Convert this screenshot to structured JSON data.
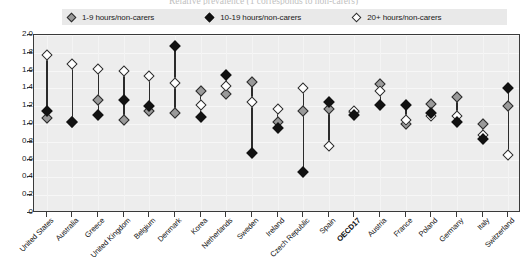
{
  "title": "Relative prevalence (1 corresponds to non-carers)",
  "legend": {
    "items": [
      {
        "label": "1-9 hours/non-carers",
        "marker": "gray-diamond-icon",
        "color": "#9a9a9a"
      },
      {
        "label": "10-19 hours/non-carers",
        "marker": "black-diamond-icon",
        "color": "#121212"
      },
      {
        "label": "20+ hours/non-carers",
        "marker": "white-diamond-icon",
        "color": "#ffffff"
      }
    ]
  },
  "chart_data": {
    "type": "scatter",
    "title": "Relative prevalence (1 corresponds to non-carers)",
    "xlabel": "",
    "ylabel": "",
    "ylim": [
      0,
      2.0
    ],
    "yticks": [
      "0",
      "0.2",
      "0.4",
      "0.6",
      "0.8",
      "1.0",
      "1.2",
      "1.4",
      "1.6",
      "1.8",
      "2.0"
    ],
    "grid": true,
    "legend_position": "top",
    "categories": [
      "United States",
      "Australia",
      "Greece",
      "United Kingdom",
      "Belgium",
      "Denmark",
      "Korea",
      "Netherlands",
      "Sweden",
      "Ireland",
      "Czech Republic",
      "Spain",
      "OECD17",
      "Austria",
      "France",
      "Poland",
      "Germany",
      "Italy",
      "Switzerland"
    ],
    "highlight_category": "OECD17",
    "series": [
      {
        "name": "1-9 hours/non-carers",
        "marker": "gray-diamond-icon",
        "values": [
          1.07,
          1.02,
          1.27,
          1.04,
          1.15,
          1.12,
          1.37,
          1.34,
          1.47,
          1.02,
          1.15,
          1.17,
          1.13,
          1.45,
          1.0,
          1.22,
          1.3,
          1.0,
          1.2
        ]
      },
      {
        "name": "10-19 hours/non-carers",
        "marker": "black-diamond-icon",
        "values": [
          1.15,
          1.02,
          1.1,
          1.27,
          1.2,
          1.88,
          1.08,
          1.55,
          0.67,
          0.96,
          0.46,
          1.25,
          1.1,
          1.21,
          1.21,
          1.12,
          1.02,
          0.83,
          1.41
        ]
      },
      {
        "name": "20+ hours/non-carers",
        "marker": "white-diamond-icon",
        "values": [
          1.78,
          1.67,
          1.62,
          1.6,
          1.54,
          1.46,
          1.21,
          1.43,
          1.25,
          1.17,
          1.4,
          0.75,
          1.15,
          1.37,
          1.05,
          1.09,
          1.09,
          0.88,
          0.65
        ]
      }
    ]
  }
}
